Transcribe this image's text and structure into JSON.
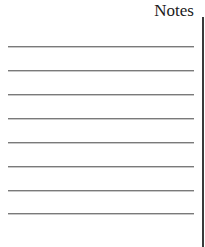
{
  "notes": {
    "title": "Notes",
    "line_count": 8,
    "line_color": "#7a7a7a",
    "border_color": "#3a3a3a"
  }
}
